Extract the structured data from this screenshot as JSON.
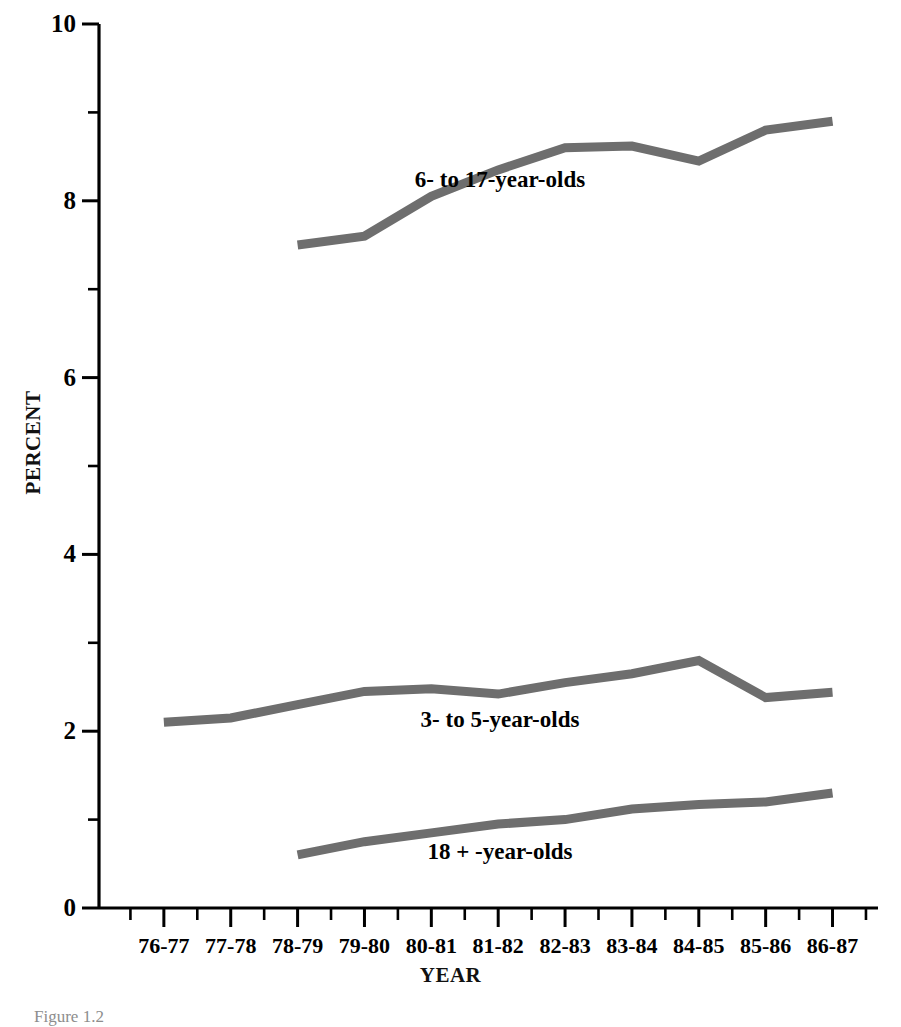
{
  "chart_data": {
    "type": "line",
    "title": "",
    "xlabel": "YEAR",
    "ylabel": "PERCENT",
    "ylim": [
      0,
      10
    ],
    "ytick_labels": [
      "0",
      "2",
      "4",
      "6",
      "8",
      "10"
    ],
    "ytick_values": [
      0,
      2,
      4,
      6,
      8,
      10
    ],
    "yminor_values": [
      1,
      3,
      5,
      7,
      9
    ],
    "grid": false,
    "legend_position": "inline-annotations",
    "categories": [
      "76-77",
      "77-78",
      "78-79",
      "79-80",
      "80-81",
      "81-82",
      "82-83",
      "83-84",
      "84-85",
      "85-86",
      "86-87"
    ],
    "series": [
      {
        "name": "6- to 17-year-olds",
        "color": "#6e6e6e",
        "x": [
          "78-79",
          "79-80",
          "80-81",
          "81-82",
          "82-83",
          "83-84",
          "84-85",
          "85-86",
          "86-87"
        ],
        "values": [
          7.5,
          7.6,
          8.05,
          8.35,
          8.6,
          8.62,
          8.45,
          8.8,
          8.9
        ]
      },
      {
        "name": "3- to 5-year-olds",
        "color": "#6e6e6e",
        "x": [
          "76-77",
          "77-78",
          "78-79",
          "79-80",
          "80-81",
          "81-82",
          "82-83",
          "83-84",
          "84-85",
          "85-86",
          "86-87"
        ],
        "values": [
          2.1,
          2.15,
          2.3,
          2.45,
          2.48,
          2.42,
          2.55,
          2.65,
          2.8,
          2.38,
          2.44
        ]
      },
      {
        "name": "18 + -year-olds",
        "color": "#6e6e6e",
        "x": [
          "78-79",
          "79-80",
          "80-81",
          "81-82",
          "82-83",
          "83-84",
          "84-85",
          "85-86",
          "86-87"
        ],
        "values": [
          0.6,
          0.75,
          0.85,
          0.95,
          1.0,
          1.12,
          1.17,
          1.2,
          1.3
        ]
      }
    ],
    "annotations": [
      {
        "text": "6- to 17-year-olds",
        "x": 500,
        "y": 168
      },
      {
        "text": "3- to 5-year-olds",
        "x": 500,
        "y": 708
      },
      {
        "text": "18 + -year-olds",
        "x": 500,
        "y": 840
      }
    ]
  },
  "caption": {
    "text": "Figure 1.2"
  },
  "axis_style": {
    "line_color": "#000000"
  }
}
